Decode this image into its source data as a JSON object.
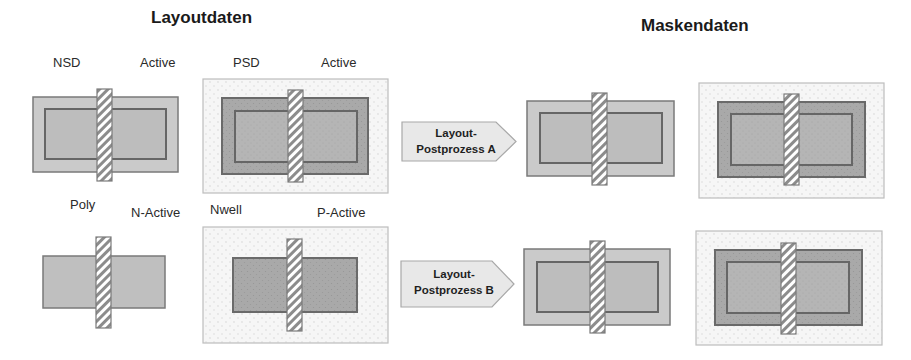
{
  "titles": {
    "left": "Layoutdaten",
    "right": "Maskendaten"
  },
  "layout_labels": {
    "fig1_a": "NSD",
    "fig1_b": "Active",
    "fig2_a": "PSD",
    "fig2_b": "Active",
    "fig3_a": "Poly",
    "fig3_b": "N-Active",
    "fig4_a": "Nwell",
    "fig4_b": "P-Active"
  },
  "arrows": [
    {
      "line1": "Layout-",
      "line2": "Postprozess A"
    },
    {
      "line1": "Layout-",
      "line2": "Postprozess B"
    }
  ],
  "colors": {
    "implant_light": "#c9c9c9",
    "active_fill": "#bdbdbd",
    "well_box": "#f4f4f4",
    "dark_implant": "#a6a6a6",
    "outline": "#6e6e6e",
    "poly_stripe": "#8a8a8a",
    "arrow_fill": "#e6e6e6"
  }
}
